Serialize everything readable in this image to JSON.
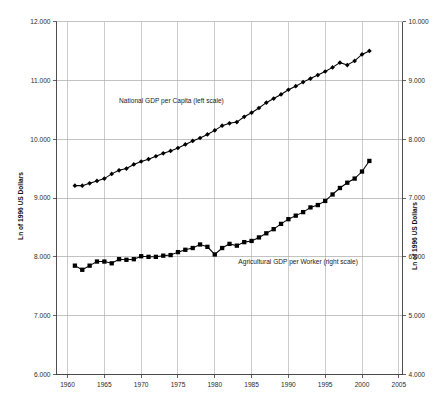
{
  "chart_data": {
    "type": "line",
    "title": "",
    "xlabel": "",
    "ylabel": "Ln of 1996 US Dollars",
    "ylabel_right": "Ln of 1996 US Dollars",
    "xlim": [
      1958.5,
      2005.5
    ],
    "ylim": [
      6.0,
      12.0
    ],
    "ylim_right": [
      4.0,
      10.0
    ],
    "grid": true,
    "legend_position": "in-plot annotations",
    "xticks": [
      1960,
      1965,
      1970,
      1975,
      1980,
      1985,
      1990,
      1995,
      2000,
      2005
    ],
    "xtick_labels": [
      "1960",
      "1965",
      "1970",
      "1975",
      "1980",
      "1985",
      "1990",
      "1995",
      "2000",
      "2005"
    ],
    "yticks_left": [
      6.0,
      7.0,
      8.0,
      9.0,
      10.0,
      11.0,
      12.0
    ],
    "ytick_labels_left": [
      "6.000",
      "7.000",
      "8.000",
      "9.000",
      "10.000",
      "11.000",
      "12.000"
    ],
    "yticks_right": [
      4.0,
      5.0,
      6.0,
      7.0,
      8.0,
      9.0,
      10.0
    ],
    "ytick_labels_right": [
      "4.000",
      "5.000",
      "6.000",
      "7.000",
      "8.000",
      "9.000",
      "10.000"
    ],
    "annotations": [
      {
        "text": "National GDP per Capita (left scale)",
        "x": 1967.0,
        "y": 10.62,
        "axis": "left"
      },
      {
        "text": "Agricultural GDP per Worker (right scale)",
        "x": 1983.2,
        "y": 5.87,
        "axis": "right"
      }
    ],
    "series": [
      {
        "name": "National GDP per Capita (left scale)",
        "axis": "left",
        "marker": "diamond",
        "color": "#000000",
        "x": [
          1961,
          1962,
          1963,
          1964,
          1965,
          1966,
          1967,
          1968,
          1969,
          1970,
          1971,
          1972,
          1973,
          1974,
          1975,
          1976,
          1977,
          1978,
          1979,
          1980,
          1981,
          1982,
          1983,
          1984,
          1985,
          1986,
          1987,
          1988,
          1989,
          1990,
          1991,
          1992,
          1993,
          1994,
          1995,
          1996,
          1997,
          1998,
          1999,
          2000,
          2001
        ],
        "values": [
          9.21,
          9.21,
          9.25,
          9.29,
          9.33,
          9.41,
          9.47,
          9.5,
          9.57,
          9.62,
          9.66,
          9.71,
          9.76,
          9.8,
          9.85,
          9.91,
          9.97,
          10.02,
          10.08,
          10.15,
          10.23,
          10.27,
          10.29,
          10.38,
          10.45,
          10.53,
          10.62,
          10.69,
          10.76,
          10.84,
          10.9,
          10.97,
          11.03,
          11.09,
          11.15,
          11.22,
          11.3,
          11.26,
          11.33,
          11.44,
          11.5
        ]
      },
      {
        "name": "Agricultural GDP per Worker (right scale)",
        "axis": "right",
        "marker": "square",
        "color": "#000000",
        "x": [
          1961,
          1962,
          1963,
          1964,
          1965,
          1966,
          1967,
          1968,
          1969,
          1970,
          1971,
          1972,
          1973,
          1974,
          1975,
          1976,
          1977,
          1978,
          1979,
          1980,
          1981,
          1982,
          1983,
          1984,
          1985,
          1986,
          1987,
          1988,
          1989,
          1990,
          1991,
          1992,
          1993,
          1994,
          1995,
          1996,
          1997,
          1998,
          1999,
          2000,
          2001
        ],
        "values": [
          5.85,
          5.78,
          5.85,
          5.92,
          5.92,
          5.89,
          5.96,
          5.95,
          5.96,
          6.01,
          6.0,
          6.0,
          6.02,
          6.03,
          6.08,
          6.12,
          6.15,
          6.21,
          6.17,
          6.04,
          6.15,
          6.22,
          6.19,
          6.25,
          6.27,
          6.33,
          6.4,
          6.47,
          6.56,
          6.64,
          6.7,
          6.76,
          6.84,
          6.88,
          6.95,
          7.06,
          7.17,
          7.26,
          7.33,
          7.45,
          7.63
        ]
      }
    ]
  },
  "axes": {
    "left_title": "Ln of 1996 US Dollars",
    "right_title": "Ln of 1996 US Dollars"
  }
}
